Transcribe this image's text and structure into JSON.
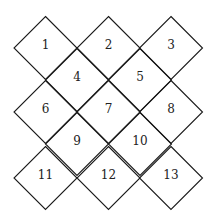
{
  "diagram": {
    "stroke_color": "#1a1a1a",
    "half_diagonal": 31.5,
    "cells": [
      {
        "label": "1",
        "cx": 45.5,
        "cy": 48
      },
      {
        "label": "2",
        "cx": 108.5,
        "cy": 48
      },
      {
        "label": "3",
        "cx": 171,
        "cy": 48
      },
      {
        "label": "4",
        "cx": 77,
        "cy": 80
      },
      {
        "label": "5",
        "cx": 140,
        "cy": 80
      },
      {
        "label": "6",
        "cx": 45.5,
        "cy": 112
      },
      {
        "label": "7",
        "cx": 108.5,
        "cy": 112
      },
      {
        "label": "8",
        "cx": 171,
        "cy": 112
      },
      {
        "label": "9",
        "cx": 77,
        "cy": 144
      },
      {
        "label": "10",
        "cx": 140,
        "cy": 144
      },
      {
        "label": "11",
        "cx": 45.5,
        "cy": 178
      },
      {
        "label": "12",
        "cx": 108.5,
        "cy": 178
      },
      {
        "label": "13",
        "cx": 171,
        "cy": 178
      }
    ]
  }
}
